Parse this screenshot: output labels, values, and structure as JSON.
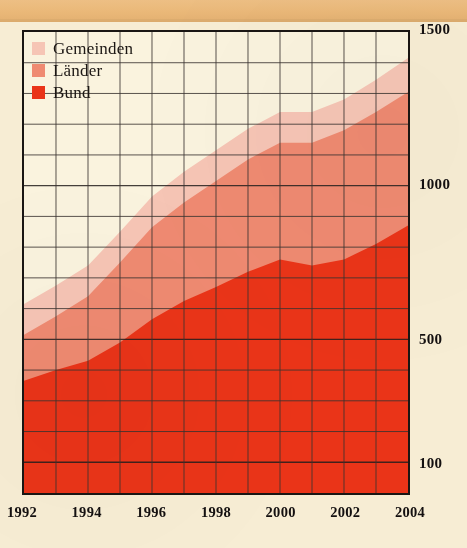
{
  "chart_data": {
    "type": "area",
    "stacked": true,
    "title": "",
    "subtitle": "",
    "xlabel": "",
    "ylabel": "",
    "x": [
      1992,
      1993,
      1994,
      1995,
      1996,
      1997,
      1998,
      1999,
      2000,
      2001,
      2002,
      2003,
      2004
    ],
    "tick_labels_x": [
      "1992",
      "1994",
      "1996",
      "1998",
      "2000",
      "2002",
      "2004"
    ],
    "tick_labels_y": [
      "1500",
      "1000",
      "500",
      "100"
    ],
    "ylim": [
      0,
      1500
    ],
    "xlim": [
      1992,
      2004
    ],
    "grid": true,
    "grid_step_y": 100,
    "grid_step_x": 1,
    "legend_position": "top-left",
    "series": [
      {
        "name": "Bund",
        "color": "#ea3418",
        "values": [
          365,
          400,
          430,
          490,
          565,
          625,
          670,
          720,
          760,
          740,
          760,
          810,
          870
        ]
      },
      {
        "name": "Länder",
        "color": "#ef8a71",
        "values": [
          150,
          175,
          210,
          260,
          300,
          320,
          345,
          365,
          380,
          400,
          420,
          430,
          435
        ]
      },
      {
        "name": "Gemeinden",
        "color": "#f6c5b5",
        "values": [
          100,
          100,
          100,
          100,
          100,
          100,
          100,
          100,
          100,
          100,
          100,
          105,
          110
        ]
      }
    ],
    "cumulative_top": {
      "bund": [
        365,
        400,
        430,
        490,
        565,
        625,
        670,
        720,
        760,
        740,
        760,
        810,
        870
      ],
      "laender": [
        515,
        575,
        640,
        750,
        865,
        945,
        1015,
        1085,
        1140,
        1140,
        1180,
        1240,
        1305
      ],
      "gemeinden": [
        615,
        675,
        740,
        850,
        965,
        1045,
        1115,
        1185,
        1240,
        1240,
        1280,
        1345,
        1415
      ]
    }
  },
  "legend": {
    "items": [
      {
        "label": "Gemeinden",
        "color": "#f6c5b5"
      },
      {
        "label": "Länder",
        "color": "#ef8a71"
      },
      {
        "label": "Bund",
        "color": "#ea3418"
      }
    ]
  },
  "axis": {
    "y_ticks": [
      {
        "label": "1500",
        "value": 1500
      },
      {
        "label": "1000",
        "value": 1000
      },
      {
        "label": "500",
        "value": 500
      },
      {
        "label": "100",
        "value": 100
      }
    ],
    "x_ticks": [
      {
        "label": "1992",
        "value": 1992
      },
      {
        "label": "1994",
        "value": 1994
      },
      {
        "label": "1996",
        "value": 1996
      },
      {
        "label": "1998",
        "value": 1998
      },
      {
        "label": "2000",
        "value": 2000
      },
      {
        "label": "2002",
        "value": 2002
      },
      {
        "label": "2004",
        "value": 2004
      }
    ]
  },
  "colors": {
    "page_background": "#f7edd4",
    "plot_background": "#faf3de",
    "top_strip": "#eab878",
    "frame": "#1a1613",
    "gridline": "#3a3330",
    "bund": "#ea3418",
    "laender": "#ef8a71",
    "gemeinden": "#f6c5b5"
  }
}
